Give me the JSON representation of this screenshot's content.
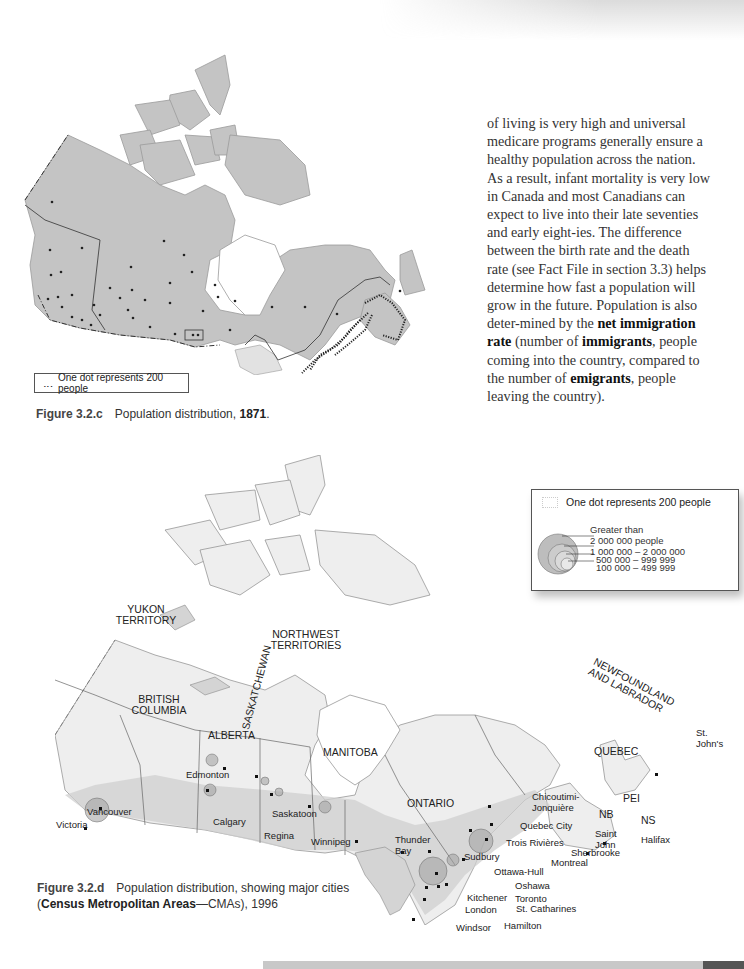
{
  "body_text": {
    "segments": [
      {
        "text": "of living is very high and universal medicare programs generally ensure a healthy population across the nation. As a result, infant mortality is very low in Canada and most Canadians can expect to live into their late seventies and early eight-ies. The difference between the birth rate and the death rate (see Fact File in section 3.3) helps determine how fast a population will grow in the future. Population is also deter-mined by the ",
        "bold": false
      },
      {
        "text": "net immigration rate",
        "bold": true
      },
      {
        "text": " (number of ",
        "bold": false
      },
      {
        "text": "immigrants",
        "bold": true
      },
      {
        "text": ", people coming into the country,  compared to the number of ",
        "bold": false
      },
      {
        "text": "emigrants",
        "bold": true
      },
      {
        "text": ", people leaving the country).",
        "bold": false
      }
    ]
  },
  "figure_c": {
    "number": "Figure 3.2.c",
    "title": "Population distribution, ",
    "year": "1871",
    "suffix": ".",
    "legend": {
      "symbol": "․‥",
      "text": "One dot represents 200 people"
    }
  },
  "figure_d": {
    "number": "Figure 3.2.d",
    "title_line1": "Population distribution, showing major cities",
    "bold_term": "Census Metropolitan Areas",
    "title_line2_rest": "—CMAs), 1996",
    "open_paren": "(",
    "legend": {
      "dot_text": "One dot represents 200 people",
      "sizes": [
        {
          "label": "Greater than\n2 000 000 people"
        },
        {
          "label": "1 000 000 – 2 000 000"
        },
        {
          "label": "500 000 – 999 999"
        },
        {
          "label": "100 000 – 499 999"
        }
      ]
    },
    "regions": [
      {
        "name": "YUKON TERRITORY"
      },
      {
        "name": "NORTHWEST TERRITORIES"
      },
      {
        "name": "BRITISH COLUMBIA"
      },
      {
        "name": "ALBERTA"
      },
      {
        "name": "SASKATCHEWAN"
      },
      {
        "name": "MANITOBA"
      },
      {
        "name": "ONTARIO"
      },
      {
        "name": "QUEBEC"
      },
      {
        "name": "NEWFOUNDLAND and LABRADOR"
      },
      {
        "name": "NB"
      },
      {
        "name": "PEI"
      },
      {
        "name": "NS"
      }
    ],
    "cities": [
      "Victoria",
      "Vancouver",
      "Edmonton",
      "Calgary",
      "Saskatoon",
      "Regina",
      "Winnipeg",
      "Thunder Bay",
      "Sudbury",
      "Ottawa-Hull",
      "Oshawa",
      "Kitchener",
      "Toronto",
      "London",
      "St. Catharines",
      "Windsor",
      "Hamilton",
      "Trois Rivières",
      "Quebec City",
      "Chicoutimi-Jonquière",
      "Montreal",
      "Sherbrooke",
      "Saint John",
      "Halifax",
      "St. John's"
    ]
  },
  "colors": {
    "land_1871": "#c4c4c4",
    "land_1996": "#e6e6e6",
    "populated": "#bdbdbd",
    "water_lakes": "#b8b8b8",
    "text": "#333333"
  }
}
